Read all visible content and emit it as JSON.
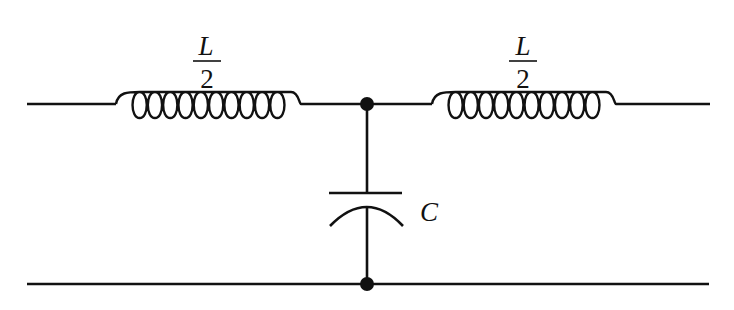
{
  "diagram": {
    "type": "circuit",
    "components": [
      {
        "id": "L1",
        "kind": "inductor",
        "label_num": "L",
        "label_den": "2"
      },
      {
        "id": "L2",
        "kind": "inductor",
        "label_num": "L",
        "label_den": "2"
      },
      {
        "id": "C1",
        "kind": "capacitor",
        "label": "C"
      }
    ],
    "nodes": [
      {
        "id": "junction-top",
        "kind": "junction-dot"
      },
      {
        "id": "junction-bottom",
        "kind": "junction-dot"
      }
    ],
    "colors": {
      "line": "#111111",
      "background": "#ffffff"
    }
  },
  "labels": {
    "l1_num": "L",
    "l1_den": "2",
    "l2_num": "L",
    "l2_den": "2",
    "cap": "C"
  }
}
